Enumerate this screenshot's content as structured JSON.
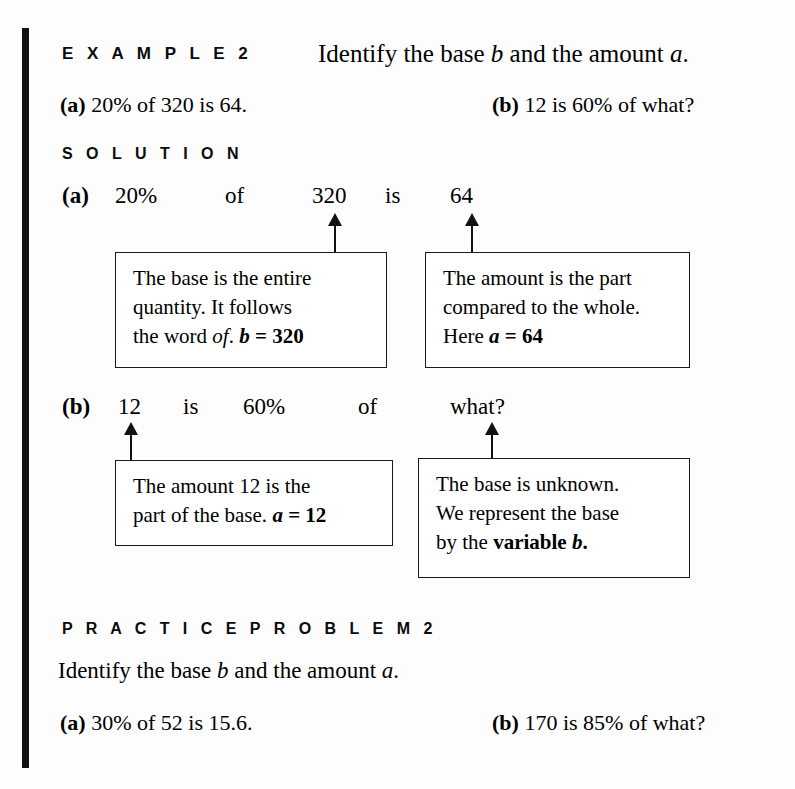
{
  "example": {
    "label": "E X A M P L E   2",
    "prompt_pre": "Identify the base ",
    "prompt_var_b": "b",
    "prompt_mid": " and the amount ",
    "prompt_var_a": "a",
    "prompt_end": ".",
    "items": [
      {
        "marker": "(a)",
        "text": "20% of 320 is 64."
      },
      {
        "marker": "(b)",
        "text": "12 is 60% of what?"
      }
    ]
  },
  "solution": {
    "label": "S O L U T I O N",
    "row_a": {
      "marker": "(a)",
      "tokens": [
        "20%",
        "of",
        "320",
        "is",
        "64"
      ]
    },
    "row_b": {
      "marker": "(b)",
      "tokens": [
        "12",
        "is",
        "60%",
        "of",
        "what?"
      ]
    }
  },
  "callouts": {
    "base": {
      "line1": "The base is the entire",
      "line2": "quantity. It follows",
      "line3_pre": "the word ",
      "line3_ital": "of",
      "line3_mid": ". ",
      "line3_var": "b",
      "line3_eq": " = 320"
    },
    "amount": {
      "line1": "The amount is the part",
      "line2": "compared to the whole.",
      "line3_pre": "Here ",
      "line3_var": "a",
      "line3_eq": " = 64"
    },
    "part": {
      "line1": "The amount 12 is the",
      "line2_pre": "part of the base. ",
      "line2_var": "a",
      "line2_eq": " = 12"
    },
    "unknown": {
      "line1": "The base is unknown.",
      "line2": "We represent the base",
      "line3_pre": "by the ",
      "line3_bold": "variable ",
      "line3_var": "b",
      "line3_end": "."
    }
  },
  "practice": {
    "label": "P R A C T I C E   P R O B L E M   2",
    "prompt_pre": "Identify the base ",
    "prompt_var_b": "b",
    "prompt_mid": " and the amount ",
    "prompt_var_a": "a",
    "prompt_end": ".",
    "items": [
      {
        "marker": "(a)",
        "text": "30% of 52 is 15.6."
      },
      {
        "marker": "(b)",
        "text": "170 is 85% of what?"
      }
    ]
  },
  "layout": {
    "solution_row_a_x": [
      62,
      115,
      225,
      312,
      385,
      450
    ],
    "solution_row_b_x": [
      62,
      118,
      183,
      243,
      358,
      450
    ],
    "ink_color": "#111111",
    "page_color": "#fdfdfd"
  }
}
